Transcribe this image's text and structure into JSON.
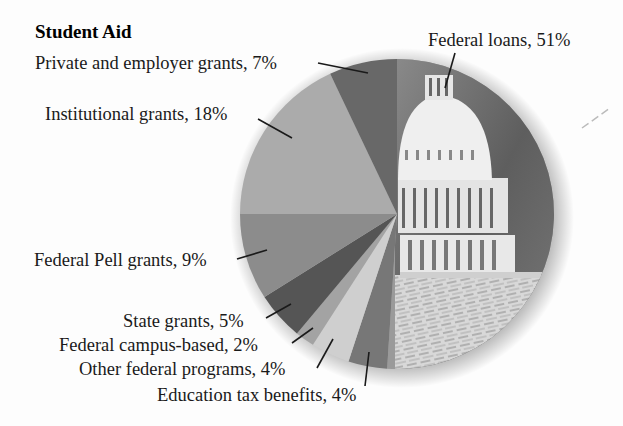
{
  "chart_data": {
    "type": "pie",
    "title": "Student Aid",
    "start": "top, clockwise",
    "slices": [
      {
        "label": "Federal loans",
        "value": 51,
        "display": "Federal loans, 51%",
        "fill": "photo",
        "color": "#9a9a9a"
      },
      {
        "label": "Education tax benefits",
        "value": 4,
        "display": "Education tax benefits, 4%",
        "color": "#777777"
      },
      {
        "label": "Other federal programs",
        "value": 4,
        "display": "Other federal programs, 4%",
        "color": "#cfcfcf"
      },
      {
        "label": "Federal campus-based",
        "value": 2,
        "display": "Federal campus-based, 2%",
        "color": "#a3a3a3"
      },
      {
        "label": "State grants",
        "value": 5,
        "display": "State grants, 5%",
        "color": "#555555"
      },
      {
        "label": "Federal Pell grants",
        "value": 9,
        "display": "Federal Pell grants, 9%",
        "color": "#8c8c8c"
      },
      {
        "label": "Institutional grants",
        "value": 18,
        "display": "Institutional grants, 18%",
        "color": "#ababab"
      },
      {
        "label": "Private and employer grants",
        "value": 7,
        "display": "Private and employer grants, 7%",
        "color": "#686868"
      }
    ],
    "units": "%"
  }
}
